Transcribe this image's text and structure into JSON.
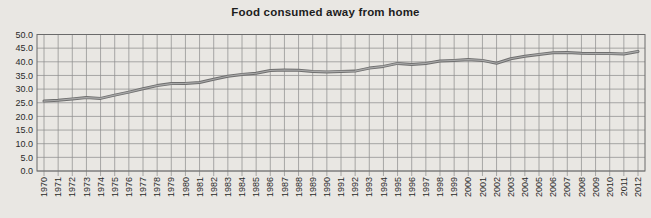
{
  "chart_data": {
    "type": "line",
    "title": "Food consumed away from home",
    "xlabel": "",
    "ylabel": "",
    "ylim": [
      0,
      50
    ],
    "y_tick_labels": [
      "0.0",
      "5.0",
      "10.0",
      "15.0",
      "20.0",
      "25.0",
      "30.0",
      "35.0",
      "40.0",
      "45.0",
      "50.0"
    ],
    "grid": "both",
    "legend_position": "none",
    "x": [
      "1970",
      "1971",
      "1972",
      "1973",
      "1974",
      "1975",
      "1976",
      "1977",
      "1978",
      "1979",
      "1980",
      "1981",
      "1982",
      "1983",
      "1984",
      "1985",
      "1986",
      "1987",
      "1988",
      "1989",
      "1990",
      "1991",
      "1992",
      "1993",
      "1994",
      "1995",
      "1996",
      "1997",
      "1998",
      "1999",
      "2000",
      "2001",
      "2002",
      "2003",
      "2004",
      "2005",
      "2006",
      "2007",
      "2008",
      "2009",
      "2010",
      "2011",
      "2012"
    ],
    "values": [
      25.6,
      25.9,
      26.4,
      26.9,
      26.6,
      27.8,
      28.9,
      30.1,
      31.3,
      32.0,
      32.1,
      32.4,
      33.6,
      34.7,
      35.4,
      35.8,
      36.8,
      37.0,
      36.9,
      36.5,
      36.3,
      36.5,
      36.6,
      37.7,
      38.3,
      39.4,
      39.0,
      39.4,
      40.3,
      40.5,
      40.8,
      40.5,
      39.5,
      41.1,
      42.0,
      42.7,
      43.3,
      43.4,
      43.1,
      43.0,
      43.0,
      42.9,
      43.8
    ],
    "colors": {
      "background": "#e9e7e3",
      "gridline": "#8f8f8f",
      "plot_border": "#6a6a6a",
      "line": "#6f6f6f",
      "line_highlight": "#a9a9a9",
      "tick_text": "#2a2a2a",
      "title_text": "#1d1d1d"
    }
  }
}
